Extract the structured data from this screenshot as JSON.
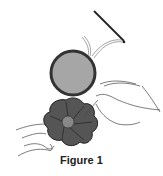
{
  "figure": {
    "caption": "Figure 1",
    "illustration": "sewing-yo-yo-fabric-circle",
    "colors": {
      "fabric_light": "#a6a6a6",
      "fabric_dark": "#555555",
      "outline": "#333333",
      "line": "#444444"
    }
  }
}
